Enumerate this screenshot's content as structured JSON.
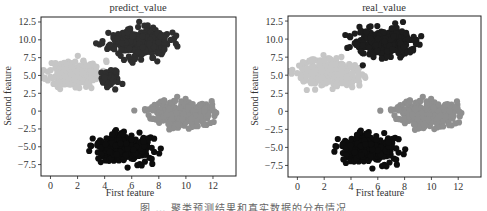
{
  "caption": "图 … 聚类预测结果和真实数据的分布情况",
  "colors": {
    "cluster_black": "#0d0d0d",
    "cluster_dark": "#2e2e2e",
    "cluster_mid": "#8f8f8f",
    "cluster_light": "#c6c6c6",
    "axis": "#222222"
  },
  "chart_data": [
    {
      "type": "scatter",
      "title": "predict_value",
      "xlabel": "First feature",
      "ylabel": "Second feature",
      "xlim": [
        -0.7,
        13.7
      ],
      "ylim": [
        -9.1,
        13.2
      ],
      "xticks": [
        0,
        2,
        4,
        6,
        8,
        10,
        12
      ],
      "yticks": [
        12.5,
        10.0,
        7.5,
        5.0,
        2.5,
        0,
        -2.5,
        -5.0,
        -7.5
      ],
      "ytick_labels": [
        "12.5",
        "10.0",
        "7.5",
        "5.0",
        "2.5",
        "0",
        "−2.5",
        "−5.0",
        "−7.5"
      ],
      "grid": false,
      "legend": null,
      "series": [
        {
          "name": "cluster_light",
          "color": "#c6c6c6",
          "center": [
            1.8,
            5.3
          ],
          "spread": [
            1.0,
            0.9
          ],
          "n": 260,
          "x_max": 4.3,
          "seed": 11
        },
        {
          "name": "cluster_dark",
          "color": "#2e2e2e",
          "center": [
            6.6,
            9.6
          ],
          "spread": [
            1.1,
            0.95
          ],
          "n": 300,
          "seed": 23
        },
        {
          "name": "cluster_dark_tail",
          "color": "#2e2e2e",
          "center": [
            4.3,
            4.6
          ],
          "spread": [
            0.45,
            0.6
          ],
          "n": 45,
          "seed": 29
        },
        {
          "name": "cluster_mid",
          "color": "#8f8f8f",
          "center": [
            9.6,
            -0.3
          ],
          "spread": [
            1.1,
            0.95
          ],
          "n": 260,
          "seed": 37
        },
        {
          "name": "cluster_black",
          "color": "#0d0d0d",
          "center": [
            5.4,
            -5.2
          ],
          "spread": [
            1.05,
            0.95
          ],
          "n": 320,
          "seed": 41
        }
      ]
    },
    {
      "type": "scatter",
      "title": "real_value",
      "xlabel": "First feature",
      "ylabel": "Second feature",
      "xlim": [
        -0.7,
        13.7
      ],
      "ylim": [
        -9.1,
        13.2
      ],
      "xticks": [
        0,
        2,
        4,
        6,
        8,
        10,
        12
      ],
      "yticks": [
        12.5,
        10.0,
        7.5,
        5.0,
        2.5,
        0,
        -2.5,
        -5.0,
        -7.5
      ],
      "ytick_labels": [
        "12.5",
        "10.0",
        "7.5",
        "5.0",
        "2.5",
        "0",
        "−2.5",
        "−5.0",
        "−7.5"
      ],
      "grid": false,
      "legend": null,
      "series": [
        {
          "name": "cluster_light",
          "color": "#c6c6c6",
          "center": [
            2.3,
            5.3
          ],
          "spread": [
            1.15,
            0.95
          ],
          "n": 300,
          "seed": 51
        },
        {
          "name": "cluster_dark",
          "color": "#1c1c1c",
          "center": [
            6.5,
            9.5
          ],
          "spread": [
            1.0,
            0.95
          ],
          "n": 300,
          "seed": 63
        },
        {
          "name": "cluster_mid",
          "color": "#8f8f8f",
          "center": [
            9.6,
            -0.3
          ],
          "spread": [
            1.1,
            0.95
          ],
          "n": 260,
          "seed": 37
        },
        {
          "name": "cluster_black",
          "color": "#0d0d0d",
          "center": [
            5.3,
            -5.2
          ],
          "spread": [
            1.05,
            0.95
          ],
          "n": 320,
          "seed": 41
        }
      ]
    }
  ]
}
